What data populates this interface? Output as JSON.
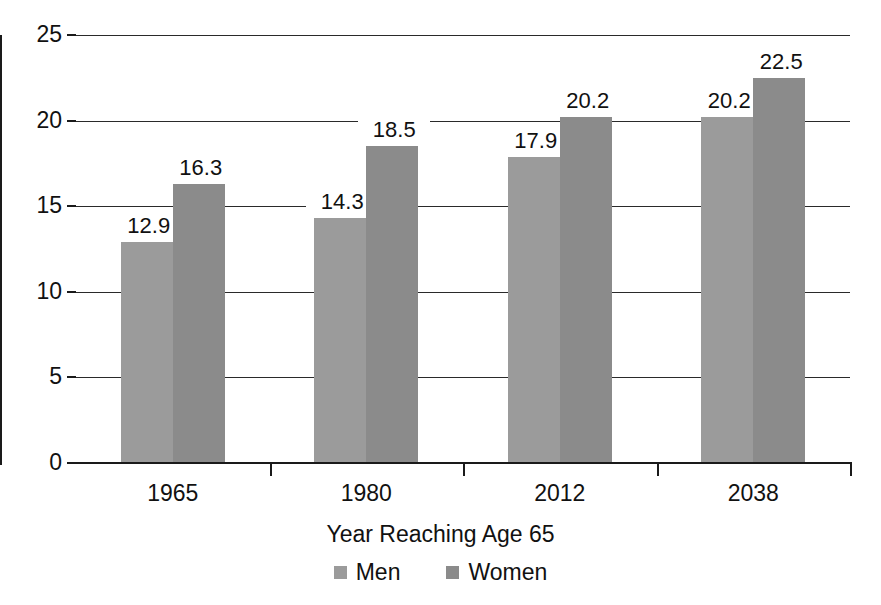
{
  "chart_data": {
    "type": "bar",
    "title": "",
    "subtitle": "",
    "xlabel": "Year Reaching Age 65",
    "ylabel": "",
    "categories": [
      "1965",
      "1980",
      "2012",
      "2038"
    ],
    "series": [
      {
        "name": "Men",
        "values": [
          12.9,
          14.3,
          17.9,
          20.2
        ],
        "color": "#9b9b9b"
      },
      {
        "name": "Women",
        "values": [
          16.3,
          18.5,
          20.2,
          22.5
        ],
        "color": "#8b8b8b"
      }
    ],
    "ylim": [
      0,
      25
    ],
    "yticks": [
      0,
      5,
      10,
      15,
      20,
      25
    ],
    "ytick_labels": [
      "0",
      "5",
      "10",
      "15",
      "20",
      "25"
    ],
    "grid": true,
    "grid_axis": "y",
    "legend_position": "bottom",
    "data_labels": true,
    "background": "#ffffff",
    "axis_color": "#1a1a1a"
  },
  "axis": {
    "x_title": "Year Reaching Age 65"
  },
  "legend": {
    "items": [
      {
        "label": "Men"
      },
      {
        "label": "Women"
      }
    ]
  }
}
